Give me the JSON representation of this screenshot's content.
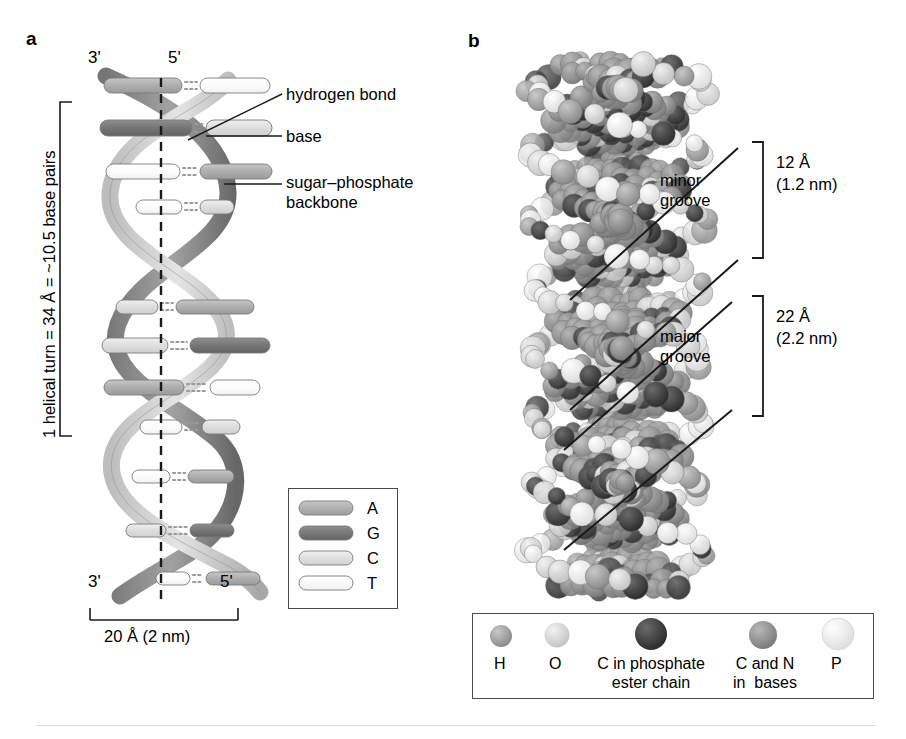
{
  "figure": {
    "panels": [
      {
        "letter": "a",
        "name": "ribbon-helix-diagram"
      },
      {
        "letter": "b",
        "name": "space-filling-model"
      }
    ]
  },
  "panel_a": {
    "letter": "a",
    "top_labels": {
      "left": "3'",
      "right": "5'"
    },
    "bottom_labels": {
      "left": "3'",
      "right": "5'"
    },
    "vertical_measure": "1 helical turn = 34 Å = ~10.5 base pairs",
    "width_measure": "20 Å (2 nm)",
    "callouts": [
      {
        "label": "hydrogen bond",
        "name": "callout-hydrogen-bond"
      },
      {
        "label": "base",
        "name": "callout-base"
      },
      {
        "label": "sugar–phosphate\nbackbone",
        "name": "callout-sugar-phosphate-backbone"
      }
    ],
    "base_legend": {
      "items": [
        {
          "label": "A",
          "color": "#b0b0b0"
        },
        {
          "label": "G",
          "color": "#777777"
        },
        {
          "label": "C",
          "color": "#dcdcdc"
        },
        {
          "label": "T",
          "color": "#fdfdfd"
        }
      ]
    }
  },
  "panel_b": {
    "letter": "b",
    "grooves": [
      {
        "name": "minor",
        "label": "minor\ngroove",
        "measure_angstrom": "12 Å",
        "measure_nm": "(1.2 nm)"
      },
      {
        "name": "major",
        "label": "major\ngroove",
        "measure_angstrom": "22 Å",
        "measure_nm": "(2.2 nm)"
      }
    ],
    "atom_legend": {
      "items": [
        {
          "label": "H",
          "color": "#9a9a9a"
        },
        {
          "label": "O",
          "color": "#d6d6d6"
        },
        {
          "label": "C in phosphate\nester chain",
          "color": "#3c3c3c"
        },
        {
          "label": "C and N\nin  bases",
          "color": "#8e8e8e"
        },
        {
          "label": "P",
          "color": "#ececec"
        }
      ]
    }
  },
  "colors": {
    "base_a": "#b0b0b0",
    "base_g": "#777777",
    "base_c": "#dcdcdc",
    "base_t": "#fdfdfd",
    "backbone_light": "#d2d2d2",
    "backbone_dark": "#8a8a8a",
    "line": "#1a1a1a"
  }
}
